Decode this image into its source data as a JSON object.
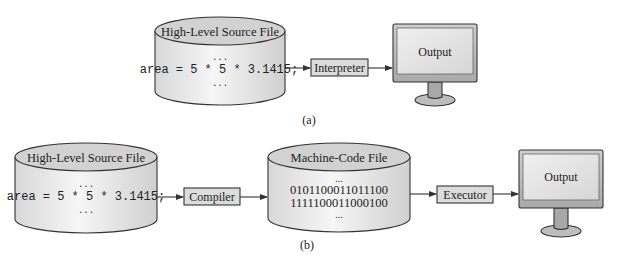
{
  "diagram": {
    "part_a": {
      "caption": "(a)",
      "source_file": {
        "title": "High-Level Source File",
        "ellipsis_top": "...",
        "code": "area = 5 * 5 * 3.1415;",
        "ellipsis_bottom": "..."
      },
      "processor": {
        "label": "Interpreter"
      },
      "output": {
        "label": "Output"
      }
    },
    "part_b": {
      "caption": "(b)",
      "source_file": {
        "title": "High-Level Source File",
        "ellipsis_top": "...",
        "code": "area = 5 * 5 * 3.1415;",
        "ellipsis_bottom": "..."
      },
      "compiler": {
        "label": "Compiler"
      },
      "machine_file": {
        "title": "Machine-Code File",
        "ellipsis_top": "...",
        "lines": [
          "0101100011011100",
          "1111100011000100"
        ],
        "ellipsis_bottom": "..."
      },
      "executor": {
        "label": "Executor"
      },
      "output": {
        "label": "Output"
      }
    }
  },
  "colors": {
    "cylinder_top": "#d2d2d2",
    "cylinder_body": "#ececec",
    "box_fill": "#dcdcdc",
    "monitor_frame": "#bdbdbd",
    "monitor_screen": "#e6e6e6",
    "stroke": "#333333"
  }
}
